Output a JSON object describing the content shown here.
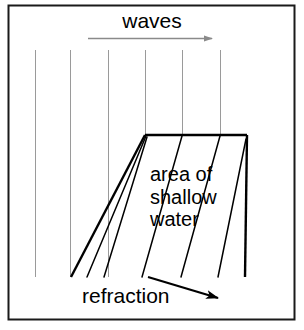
{
  "figure": {
    "background_color": "#ffffff",
    "border_color": "#000000",
    "wave_line_color": "#9a9a9a",
    "ray_color": "#000000",
    "text_color": "#000000"
  },
  "labels": {
    "waves": "waves",
    "refraction": "refraction",
    "area_line1": "area of",
    "area_line2": "shallow",
    "area_line3": "water"
  },
  "icons": {
    "waves_arrow": "arrow-right-icon",
    "refraction_arrow": "arrow-down-right-icon"
  },
  "diagram_data": {
    "type": "diagram",
    "frame": {
      "x1": 8,
      "y1": 5,
      "x2": 295,
      "y2": 320
    },
    "waves_arrow": {
      "x1": 88,
      "y1": 38,
      "x2": 218,
      "y2": 38
    },
    "refraction_arrow": {
      "x1": 148,
      "y1": 277,
      "x2": 226,
      "y2": 301
    },
    "incoming_wave_lines": [
      {
        "x": 35,
        "y1": 50,
        "y2": 277
      },
      {
        "x": 70,
        "y1": 50,
        "y2": 277
      },
      {
        "x": 108,
        "y1": 50,
        "y2": 277
      },
      {
        "x": 145,
        "y1": 50,
        "y2": 135
      },
      {
        "x": 182,
        "y1": 50,
        "y2": 135
      },
      {
        "x": 220,
        "y1": 50,
        "y2": 135
      }
    ],
    "shallow_area": {
      "top_left": {
        "x": 145,
        "y": 135
      },
      "top_right": {
        "x": 247,
        "y": 135
      },
      "bottom_right": {
        "x": 245,
        "y": 277
      },
      "bottom_left": {
        "x": 71,
        "y": 277
      }
    },
    "refracted_rays": [
      {
        "x1": 145,
        "y1": 135,
        "x2": 73,
        "y2": 277
      },
      {
        "x1": 145,
        "y1": 135,
        "x2": 88,
        "y2": 277
      },
      {
        "x1": 145,
        "y1": 135,
        "x2": 105,
        "y2": 277
      },
      {
        "x1": 182,
        "y1": 135,
        "x2": 143,
        "y2": 277
      },
      {
        "x1": 220,
        "y1": 135,
        "x2": 182,
        "y2": 277
      },
      {
        "x1": 247,
        "y1": 137,
        "x2": 219,
        "y2": 277
      }
    ]
  }
}
